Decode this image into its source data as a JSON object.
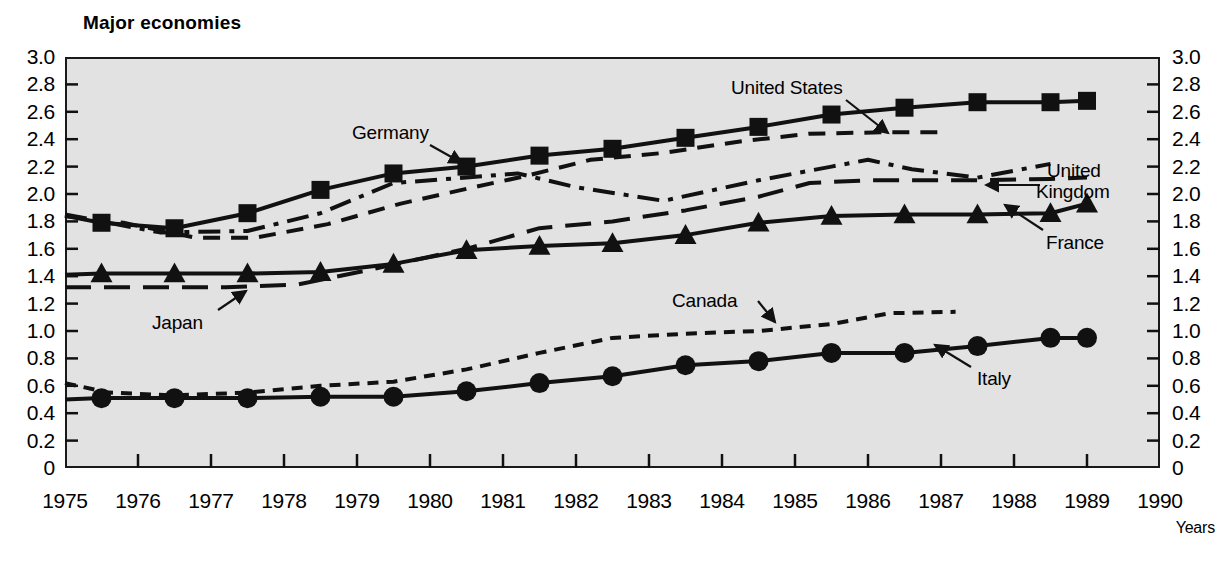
{
  "chart_data": {
    "type": "line",
    "title": "Major economies",
    "xlabel": "Years",
    "ylabel": "",
    "xlim": [
      1975,
      1990
    ],
    "ylim": [
      0,
      3.0
    ],
    "xticks": [
      1975,
      1976,
      1977,
      1978,
      1979,
      1980,
      1981,
      1982,
      1983,
      1984,
      1985,
      1986,
      1987,
      1988,
      1989,
      1990
    ],
    "xtick_labels": [
      "1975",
      "1976",
      "1977",
      "1978",
      "1979",
      "1980",
      "1981",
      "1982",
      "1983",
      "1984",
      "1985",
      "1986",
      "1987",
      "1988",
      "1989",
      "1990"
    ],
    "yticks": [
      0,
      0.2,
      0.4,
      0.6,
      0.8,
      1.0,
      1.2,
      1.4,
      1.6,
      1.8,
      2.0,
      2.2,
      2.4,
      2.6,
      2.8,
      3.0
    ],
    "ytick_labels": [
      "0",
      "0.2",
      "0.4",
      "0.6",
      "0.8",
      "1.0",
      "1.2",
      "1.4",
      "1.6",
      "1.8",
      "2.0",
      "2.2",
      "2.4",
      "2.6",
      "2.8",
      "3.0"
    ],
    "ytick_labels_right": [
      "0",
      "0.2",
      "0.4",
      "0.6",
      "0.8",
      "1.0",
      "1.2",
      "1.4",
      "1.6",
      "1.8",
      "2.0",
      "2.2",
      "2.4",
      "2.6",
      "2.8",
      "3.0"
    ],
    "grid": false,
    "legend_position": "inline-annotations",
    "background_color": "#e2e2e2",
    "line_color": "#111111",
    "series": [
      {
        "name": "Germany",
        "style": "solid",
        "marker": "square",
        "x": [
          1975.0,
          1975.5,
          1976.5,
          1977.5,
          1978.5,
          1979.5,
          1980.5,
          1981.5,
          1982.5,
          1983.5,
          1984.5,
          1985.5,
          1986.5,
          1987.5,
          1988.5,
          1989.0
        ],
        "values": [
          1.84,
          1.79,
          1.75,
          1.86,
          2.03,
          2.15,
          2.2,
          2.28,
          2.33,
          2.41,
          2.49,
          2.58,
          2.63,
          2.67,
          2.67,
          2.68
        ]
      },
      {
        "name": "United States",
        "style": "dashed",
        "marker": "none",
        "x": [
          1975.0,
          1975.8,
          1976.8,
          1977.6,
          1978.6,
          1979.6,
          1980.6,
          1981.3,
          1982.2,
          1983.2,
          1984.2,
          1985.2,
          1986.2,
          1987.0
        ],
        "values": [
          1.84,
          1.79,
          1.68,
          1.68,
          1.78,
          1.93,
          2.05,
          2.13,
          2.25,
          2.3,
          2.38,
          2.44,
          2.45,
          2.45
        ]
      },
      {
        "name": "United Kingdom",
        "style": "dashdot",
        "marker": "none",
        "x": [
          1975.0,
          1976.3,
          1977.5,
          1978.5,
          1979.5,
          1980.5,
          1981.2,
          1982.0,
          1983.2,
          1984.5,
          1985.5,
          1986.0,
          1986.6,
          1987.5,
          1988.5
        ],
        "values": [
          1.85,
          1.72,
          1.73,
          1.86,
          2.08,
          2.12,
          2.15,
          2.05,
          1.95,
          2.1,
          2.2,
          2.25,
          2.18,
          2.12,
          2.22
        ]
      },
      {
        "name": "Japan",
        "style": "longdash",
        "marker": "none",
        "x": [
          1975.0,
          1977.2,
          1978.2,
          1979.2,
          1980.5,
          1981.5,
          1982.5,
          1983.5,
          1984.5,
          1985.2,
          1986.0,
          1987.5,
          1988.5,
          1989.0
        ],
        "values": [
          1.32,
          1.32,
          1.34,
          1.45,
          1.6,
          1.75,
          1.8,
          1.88,
          1.98,
          2.08,
          2.1,
          2.1,
          2.11,
          2.12
        ]
      },
      {
        "name": "France",
        "style": "solid",
        "marker": "triangle",
        "x": [
          1975.0,
          1975.5,
          1976.5,
          1977.5,
          1978.5,
          1979.5,
          1980.5,
          1981.5,
          1982.5,
          1983.5,
          1984.5,
          1985.5,
          1986.5,
          1987.5,
          1988.5,
          1989.0
        ],
        "values": [
          1.41,
          1.42,
          1.42,
          1.42,
          1.43,
          1.49,
          1.59,
          1.62,
          1.64,
          1.7,
          1.79,
          1.84,
          1.85,
          1.85,
          1.86,
          1.93
        ]
      },
      {
        "name": "Canada",
        "style": "shortdash",
        "marker": "none",
        "x": [
          1975.0,
          1975.6,
          1976.5,
          1977.5,
          1978.5,
          1979.5,
          1980.5,
          1981.5,
          1982.5,
          1983.5,
          1984.5,
          1985.5,
          1986.3,
          1987.2
        ],
        "values": [
          0.62,
          0.55,
          0.53,
          0.55,
          0.6,
          0.63,
          0.72,
          0.84,
          0.95,
          0.98,
          1.0,
          1.05,
          1.13,
          1.14
        ]
      },
      {
        "name": "Italy",
        "style": "solid",
        "marker": "circle",
        "x": [
          1975.0,
          1975.5,
          1976.5,
          1977.5,
          1978.5,
          1979.5,
          1980.5,
          1981.5,
          1982.5,
          1983.5,
          1984.5,
          1985.5,
          1986.5,
          1987.5,
          1988.5,
          1989.0
        ],
        "values": [
          0.5,
          0.51,
          0.51,
          0.51,
          0.52,
          0.52,
          0.56,
          0.62,
          0.67,
          0.75,
          0.78,
          0.84,
          0.84,
          0.89,
          0.95,
          0.95
        ]
      }
    ],
    "annotations": [
      {
        "name": "germany",
        "text": "Germany",
        "x": 352,
        "y": 122,
        "arrow_from": [
          430,
          145
        ],
        "arrow_to": [
          462,
          163
        ]
      },
      {
        "name": "united-states",
        "text": "United States",
        "x": 731,
        "y": 77,
        "arrow_from": [
          846,
          100
        ],
        "arrow_to": [
          888,
          133
        ]
      },
      {
        "name": "united-kingdom-line1",
        "text": "United",
        "x": 1047,
        "y": 160,
        "arrow_from": [
          1040,
          185
        ],
        "arrow_to": [
          986,
          185
        ]
      },
      {
        "name": "united-kingdom-line2",
        "text": "Kingdom",
        "x": 1036,
        "y": 181,
        "arrow_from": null,
        "arrow_to": null
      },
      {
        "name": "france",
        "text": "France",
        "x": 1046,
        "y": 232,
        "arrow_from": [
          1043,
          230
        ],
        "arrow_to": [
          1005,
          205
        ]
      },
      {
        "name": "japan",
        "text": "Japan",
        "x": 152,
        "y": 312,
        "arrow_from": [
          218,
          310
        ],
        "arrow_to": [
          246,
          291
        ]
      },
      {
        "name": "canada",
        "text": "Canada",
        "x": 672,
        "y": 290,
        "arrow_from": [
          758,
          301
        ],
        "arrow_to": [
          775,
          322
        ]
      },
      {
        "name": "italy",
        "text": "Italy",
        "x": 977,
        "y": 368,
        "arrow_from": [
          971,
          367
        ],
        "arrow_to": [
          935,
          345
        ]
      }
    ]
  }
}
